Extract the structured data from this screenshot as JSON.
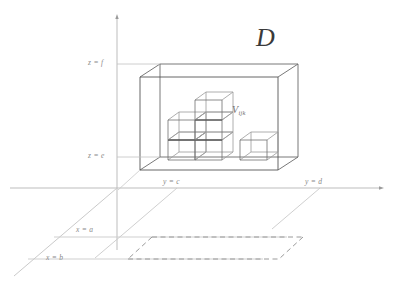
{
  "figure": {
    "title_label": "D",
    "cell_label_base": "V",
    "cell_label_sub": "ijk",
    "axis_labels": {
      "z_top": "z = f",
      "z_bottom": "z = e",
      "y_near": "y = c",
      "y_far": "y = d",
      "x_near": "x = a",
      "x_far": "x = b"
    },
    "colors": {
      "box_stroke": "#555555",
      "cell_stroke": "#6e6e6e",
      "cell_stroke_dark": "#3a3a3a",
      "axis_stroke": "#b6b6b6",
      "guide_stroke": "#c9c9c9",
      "dashed_stroke": "#8e8e8e",
      "background": "#ffffff",
      "label_text": "#8a8a8a",
      "region_text": "#3a3a3a"
    },
    "geometry": {
      "z_axis_x": 117,
      "z_axis_top_y": 15,
      "z_axis_bottom_y": 250,
      "y_axis_y": 188,
      "y_axis_left_x": 10,
      "y_axis_right_x": 382,
      "box_front_left_x": 140,
      "box_front_right_x": 278,
      "box_front_top_y": 77,
      "box_front_bottom_y": 170,
      "box_depth_dx": 20,
      "box_depth_dy": -13,
      "cell_size_w": 27,
      "cell_size_h": 20
    }
  }
}
